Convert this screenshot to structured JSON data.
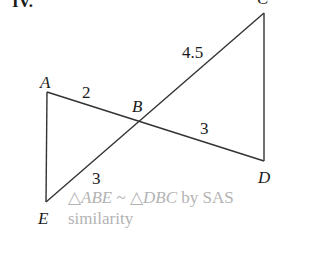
{
  "problem": {
    "number": "IV."
  },
  "diagram": {
    "points": {
      "A": {
        "label": "A"
      },
      "B": {
        "label": "B"
      },
      "C": {
        "label": "C"
      },
      "D": {
        "label": "D"
      },
      "E": {
        "label": "E"
      }
    },
    "segments": {
      "AB": "2",
      "BC": "4.5",
      "BD": "3",
      "EB": "3"
    },
    "line_color": "#333333"
  },
  "answer": {
    "line1": "△ABE ~ △DBC by SAS",
    "line1_tri1": "△ABE",
    "line1_sim": " ~ ",
    "line1_tri2": "△DBC",
    "line1_rest": " by SAS",
    "line2": "similarity",
    "color": "#b3b3b3"
  }
}
